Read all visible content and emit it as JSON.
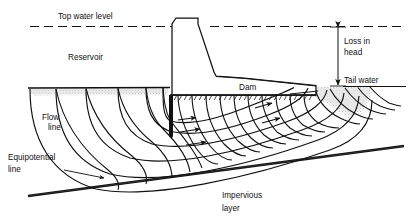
{
  "figure": {
    "kind": "seepage-flow-net-under-concrete-dam",
    "background": "#ffffff",
    "ink": "#111111",
    "water_shade": "#d9d9d9"
  },
  "labels": {
    "top_water_level": "Top water level",
    "reservoir": "Reservoir",
    "dam": "Dam",
    "loss_in_head_line1": "Loss in",
    "loss_in_head_line2": "head",
    "tail_water": "Tail water",
    "flow_line_l1": "Flow",
    "flow_line_l2": "line",
    "equipotential_l1": "Equipotential",
    "equipotential_l2": "line",
    "impervious_l1": "Impervious",
    "impervious_l2": "layer"
  },
  "geometry": {
    "top_water_level_y": 26,
    "reservoir_bed_y": 88,
    "tail_water_y": 86,
    "dam_crest_y": 18,
    "dam_base_y": 95,
    "cutoff_wall_x": 170,
    "cutoff_wall_tip_y": 139,
    "impervious_left": [
      28,
      196
    ],
    "impervious_right": [
      404,
      146
    ]
  },
  "colors": {
    "line": "#111111",
    "shade": "#d9d9d9",
    "dash": "#111111"
  }
}
